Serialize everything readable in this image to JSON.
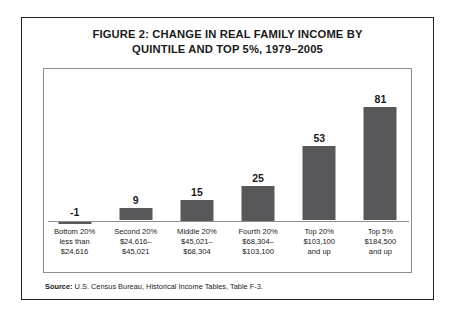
{
  "figure": {
    "title_line1": "FIGURE 2:  CHANGE IN REAL FAMILY INCOME BY",
    "title_line2": "QUINTILE AND TOP 5%, 1979–2005",
    "source_label": "Source:",
    "source_text": " U.S. Census Bureau, Historical Income Tables, Table F-3."
  },
  "colors": {
    "bar_fill": "#58585a",
    "outer_frame": "#231f20",
    "plot_border": "#8d8d8d",
    "axis_line": "#8d8d8d",
    "text": "#1a1a1a"
  },
  "chart_data": {
    "type": "bar",
    "title": "FIGURE 2:  CHANGE IN REAL FAMILY INCOME BY QUINTILE AND TOP 5%, 1979–2005",
    "xlabel": "",
    "ylabel": "",
    "ylim": [
      -5,
      90
    ],
    "grid": false,
    "legend": "none",
    "categories": [
      "Bottom 20%\nless than\n$24,616",
      "Second 20%\n$24,616–\n$45,021",
      "Middle 20%\n$45,021–\n$68,304",
      "Fourth 20%\n$68,304–\n$103,100",
      "Top 20%\n$103,100\nand up",
      "Top 5%\n$184,500\nand up"
    ],
    "values": [
      -1,
      9,
      15,
      25,
      53,
      81
    ],
    "data_labels": [
      "-1",
      "9",
      "15",
      "25",
      "53",
      "81"
    ],
    "bars": [
      {
        "name": "Bottom 20%",
        "value": -1,
        "label": "-1",
        "cat_line1": "Bottom 20%",
        "cat_line2": "less than",
        "cat_line3": "$24,616"
      },
      {
        "name": "Second 20%",
        "value": 9,
        "label": "9",
        "cat_line1": "Second 20%",
        "cat_line2": "$24,616–",
        "cat_line3": "$45,021"
      },
      {
        "name": "Middle 20%",
        "value": 15,
        "label": "15",
        "cat_line1": "Middle 20%",
        "cat_line2": "$45,021–",
        "cat_line3": "$68,304"
      },
      {
        "name": "Fourth 20%",
        "value": 25,
        "label": "25",
        "cat_line1": "Fourth 20%",
        "cat_line2": "$68,304–",
        "cat_line3": "$103,100"
      },
      {
        "name": "Top 20%",
        "value": 53,
        "label": "53",
        "cat_line1": "Top 20%",
        "cat_line2": "$103,100",
        "cat_line3": "and up"
      },
      {
        "name": "Top 5%",
        "value": 81,
        "label": "81",
        "cat_line1": "Top 5%",
        "cat_line2": "$184,500",
        "cat_line3": "and up"
      }
    ]
  }
}
